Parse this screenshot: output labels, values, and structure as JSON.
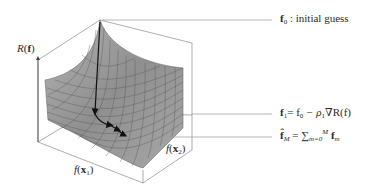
{
  "diagram": {
    "axes": {
      "z_label_func": "R",
      "z_label_arg": "f",
      "x1_label_func": "f",
      "x1_label_arg": "x",
      "x1_label_sub": "1",
      "x2_label_func": "f",
      "x2_label_arg": "x",
      "x2_label_sub": "2"
    },
    "annotations": [
      {
        "id": "initial-guess",
        "symbol": "f",
        "sub": "0",
        "text": ": initial guess"
      },
      {
        "id": "update-step",
        "lhs": "f",
        "lhs_sub": "1",
        "rhs": "= f",
        "rhs_sub": "0",
        "rest": " − ρ",
        "rho_sub": "1",
        "grad": "∇R(f)"
      },
      {
        "id": "final-estimate",
        "lhs": "f̂",
        "lhs_sub": "M",
        "eq": " = ∑",
        "sum_sub": "m=0",
        "sum_sup": "M",
        "term": " f",
        "term_sub": "m"
      }
    ],
    "colors": {
      "surface": "#9a9a9a",
      "surface_dark": "#6e6e6e",
      "grid": "#555555",
      "box": "#8a8a8a",
      "path": "#111111",
      "leader": "#9a9a9a"
    }
  }
}
